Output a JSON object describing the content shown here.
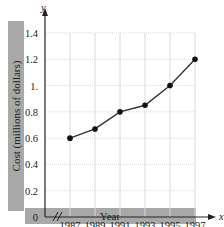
{
  "chart_data": {
    "type": "line",
    "title": "",
    "xlabel": "Year",
    "ylabel": "Cost (millions of dollars)",
    "x_axis_symbol": "x",
    "y_axis_symbol": "y",
    "categories": [
      "1987",
      "1989",
      "1991",
      "1993",
      "1995",
      "1997"
    ],
    "values": [
      0.6,
      0.67,
      0.8,
      0.85,
      1.0,
      1.2
    ],
    "y_ticks": [
      "0",
      "0.2",
      "0.4",
      "0.6",
      "0.8",
      "1.",
      "1.2",
      "1.4"
    ],
    "ylim": [
      0,
      1.4
    ],
    "grid": true,
    "axis_break": true,
    "legend": null,
    "colors": {
      "line": "#333333",
      "marker": "#111111",
      "grid": "#d9d9d9",
      "label_band": "#a8a8a8"
    }
  }
}
